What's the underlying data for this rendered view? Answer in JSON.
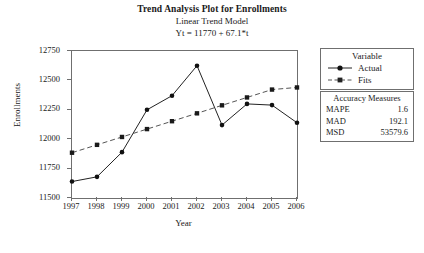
{
  "titles": {
    "main": "Trend Analysis Plot for Enrollments",
    "subtitle": "Linear Trend Model",
    "equation": "Yt = 11770 + 67.1*t"
  },
  "legend": {
    "title": "Variable",
    "items": [
      {
        "label": "Actual",
        "marker": "circle-marker",
        "style": "solid",
        "color": "#222222"
      },
      {
        "label": "Fits",
        "marker": "square-marker",
        "style": "dashed",
        "color": "#555555"
      }
    ]
  },
  "accuracy": {
    "title": "Accuracy Measures",
    "rows": [
      {
        "name": "MAPE",
        "value": "1.6"
      },
      {
        "name": "MAD",
        "value": "192.1"
      },
      {
        "name": "MSD",
        "value": "53579.6"
      }
    ]
  },
  "chart_data": {
    "type": "line",
    "title": "Trend Analysis Plot for Enrollments",
    "subtitle": "Linear Trend Model",
    "annotation": "Yt = 11770 + 67.1*t",
    "xlabel": "Year",
    "ylabel": "Enrollments",
    "categories": [
      1997,
      1998,
      1999,
      2000,
      2001,
      2002,
      2003,
      2004,
      2005,
      2006
    ],
    "xtick_labels": [
      "1997",
      "1998",
      "1999",
      "2000",
      "2001",
      "2002",
      "2003",
      "2004",
      "2005",
      "2006"
    ],
    "ytick_labels": [
      "11500",
      "11750",
      "12000",
      "12250",
      "12500",
      "12750"
    ],
    "ytick_values": [
      11500,
      11750,
      12000,
      12250,
      12500,
      12750
    ],
    "ylim": [
      11500,
      12750
    ],
    "xlim": [
      1997,
      2006
    ],
    "grid": false,
    "legend_position": "right",
    "series": [
      {
        "name": "Actual",
        "style": "solid",
        "marker": "circle",
        "color": "#222222",
        "values": [
          11640,
          11680,
          11890,
          12250,
          12370,
          12625,
          12120,
          12300,
          12290,
          12140
        ]
      },
      {
        "name": "Fits",
        "style": "dashed",
        "marker": "square",
        "color": "#555555",
        "values": [
          11885,
          11952,
          12019,
          12086,
          12153,
          12220,
          12288,
          12355,
          12422,
          12440
        ]
      }
    ]
  }
}
